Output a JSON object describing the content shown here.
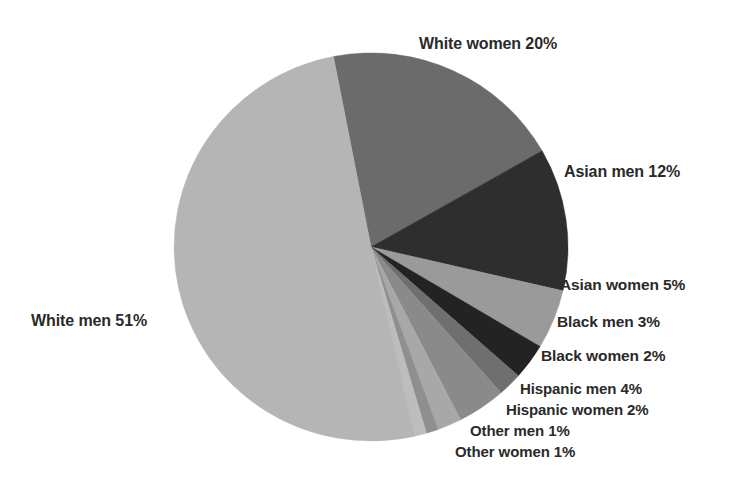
{
  "chart_data": {
    "type": "pie",
    "title": "",
    "subtitle": "",
    "xlabel": "",
    "ylabel": "",
    "legend_position": "none",
    "grid": false,
    "labels_inline": true,
    "unit": "%",
    "total": 101,
    "start_angle_deg": -11,
    "direction": "clockwise",
    "categories": [
      "White women",
      "Asian men",
      "Asian women",
      "Black men",
      "Black women",
      "Hispanic men",
      "Hispanic women",
      "Other men",
      "Other women",
      "White men"
    ],
    "values": [
      20,
      12,
      5,
      3,
      2,
      4,
      2,
      1,
      1,
      51
    ],
    "colors": [
      "#6b6b6b",
      "#2e2e2e",
      "#9a9a9a",
      "#232323",
      "#6f6f6f",
      "#8a8a8a",
      "#a8a8a8",
      "#8f8f8f",
      "#bdbdbd",
      "#b5b5b5"
    ],
    "slices": [
      {
        "name": "White women",
        "value": 20,
        "label": "White women 20%",
        "color": "#6b6b6b"
      },
      {
        "name": "Asian men",
        "value": 12,
        "label": "Asian men 12%",
        "color": "#2e2e2e"
      },
      {
        "name": "Asian women",
        "value": 5,
        "label": "Asian women 5%",
        "color": "#9a9a9a"
      },
      {
        "name": "Black men",
        "value": 3,
        "label": "Black men 3%",
        "color": "#232323"
      },
      {
        "name": "Black women",
        "value": 2,
        "label": "Black women 2%",
        "color": "#6f6f6f"
      },
      {
        "name": "Hispanic men",
        "value": 4,
        "label": "Hispanic men 4%",
        "color": "#8a8a8a"
      },
      {
        "name": "Hispanic women",
        "value": 2,
        "label": "Hispanic women 2%",
        "color": "#a8a8a8"
      },
      {
        "name": "Other men",
        "value": 1,
        "label": "Other men 1%",
        "color": "#8f8f8f"
      },
      {
        "name": "Other women",
        "value": 1,
        "label": "Other women 1%",
        "color": "#bdbdbd"
      },
      {
        "name": "White men",
        "value": 51,
        "label": "White men 51%",
        "color": "#b5b5b5"
      }
    ]
  },
  "labels": {
    "white_women": "White women 20%",
    "asian_men": "Asian men 12%",
    "asian_women": "Asian women 5%",
    "black_men": "Black men 3%",
    "black_women": "Black women 2%",
    "hispanic_men": "Hispanic men 4%",
    "hispanic_women": "Hispanic women 2%",
    "other_men": "Other men 1%",
    "other_women": "Other women 1%",
    "white_men": "White men 51%"
  },
  "geometry": {
    "cx": 371,
    "cy": 247,
    "rx": 197,
    "ry": 194
  },
  "background_color": "#ffffff",
  "text_color": "#2a2a2a"
}
